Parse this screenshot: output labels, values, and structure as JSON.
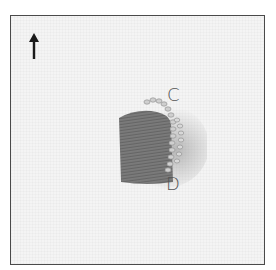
{
  "figure": {
    "labels": {
      "c": "C",
      "d": "D"
    },
    "arrow": {
      "icon": "arrow-up-icon",
      "direction": "up"
    },
    "colors": {
      "frame_border": "#4a4a4a",
      "fabric": "#f4f4f4",
      "satin_thread": "#6e6e6e",
      "couched_thread": "#c8c8c8",
      "label_text": "#555555"
    }
  }
}
